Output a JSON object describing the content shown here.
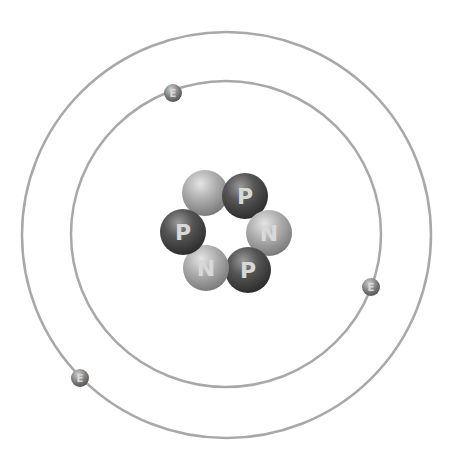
{
  "diagram": {
    "type": "atom-model",
    "colors": {
      "background": "#ffffff",
      "orbit": "#a8a8a8",
      "proton": "#4a4a4a",
      "neutron": "#a0a0a0",
      "electron": "#7a7a7a"
    },
    "orbits": [
      {
        "name": "inner-orbit",
        "cx": 226,
        "cy": 234,
        "rx": 155,
        "ry": 153
      },
      {
        "name": "outer-orbit",
        "cx": 226.5,
        "cy": 235,
        "rx": 204.5,
        "ry": 203
      }
    ],
    "nucleus": [
      {
        "kind": "neutron",
        "label": "",
        "x": 205,
        "y": 193
      },
      {
        "kind": "proton",
        "label": "P",
        "x": 245,
        "y": 196
      },
      {
        "kind": "neutron",
        "label": "N",
        "x": 269,
        "y": 233
      },
      {
        "kind": "proton",
        "label": "P",
        "x": 248,
        "y": 270
      },
      {
        "kind": "neutron",
        "label": "N",
        "x": 206,
        "y": 268
      },
      {
        "kind": "proton",
        "label": "P",
        "x": 183,
        "y": 232
      }
    ],
    "electrons": [
      {
        "label": "E",
        "x": 173,
        "y": 93
      },
      {
        "label": "E",
        "x": 371,
        "y": 287
      },
      {
        "label": "E",
        "x": 80,
        "y": 378
      }
    ]
  }
}
